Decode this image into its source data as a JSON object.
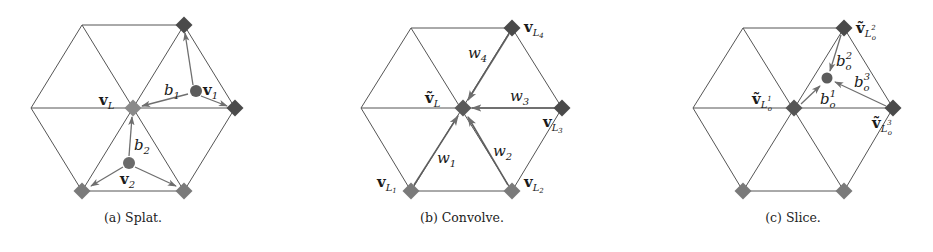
{
  "figure": {
    "colors": {
      "edge": "#555555",
      "arrow": "#6e6e6e",
      "vertex_dark": "#4a4a4a",
      "vertex_mid": "#6a6a6a",
      "vertex_light": "#8a8a8a",
      "point": "#5c5c5c"
    },
    "panels": [
      {
        "id": "a",
        "caption": "(a) Splat.",
        "labels": {
          "center_main": "v",
          "center_sub": "L",
          "b1_main": "b",
          "b1_sub": "1",
          "v1_main": "v",
          "v1_sub": "1",
          "b2_main": "b",
          "b2_sub": "2",
          "v2_main": "v",
          "v2_sub": "2"
        }
      },
      {
        "id": "b",
        "caption": "(b) Convolve.",
        "labels": {
          "center_main": "ṽ",
          "center_sub": "L",
          "w1_main": "w",
          "w1_sub": "1",
          "w2_main": "w",
          "w2_sub": "2",
          "w3_main": "w",
          "w3_sub": "3",
          "w4_main": "w",
          "w4_sub": "4",
          "vL1_main": "v",
          "vL1_sub": "L",
          "vL1_subsub": "1",
          "vL2_main": "v",
          "vL2_sub": "L",
          "vL2_subsub": "2",
          "vL3_main": "v",
          "vL3_sub": "L",
          "vL3_subsub": "3",
          "vL4_main": "v",
          "vL4_sub": "L",
          "vL4_subsub": "4"
        }
      },
      {
        "id": "c",
        "caption": "(c) Slice.",
        "labels": {
          "v1_main": "ṽ",
          "v1_sub": "L",
          "v1_sup": "1",
          "v1_subsub": "o",
          "v2_main": "ṽ",
          "v2_sub": "L",
          "v2_sup": "2",
          "v2_subsub": "o",
          "v3_main": "ṽ",
          "v3_sub": "L",
          "v3_sup": "3",
          "v3_subsub": "o",
          "b1_main": "b",
          "b1_sub": "o",
          "b1_sup": "1",
          "b2_main": "b",
          "b2_sub": "o",
          "b2_sup": "2",
          "b3_main": "b",
          "b3_sub": "o",
          "b3_sup": "3"
        }
      }
    ]
  }
}
